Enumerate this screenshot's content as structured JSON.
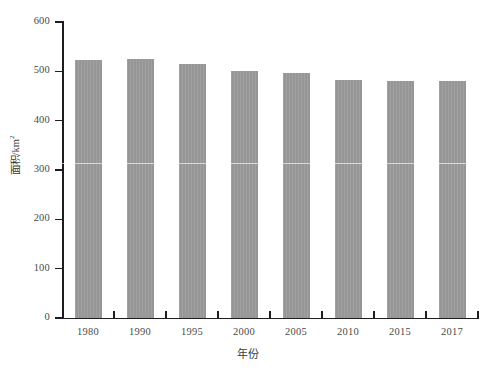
{
  "chart_data": {
    "type": "bar",
    "title": "",
    "subtitle": "",
    "categories": [
      "1980",
      "1990",
      "1995",
      "2000",
      "2005",
      "2010",
      "2015",
      "2017"
    ],
    "values": [
      522,
      525,
      515,
      501,
      496,
      483,
      481,
      481
    ],
    "series": [
      {
        "name": "面积",
        "values": [
          522,
          525,
          515,
          501,
          496,
          483,
          481,
          481
        ]
      }
    ],
    "xlabel": "年份",
    "ylabel": "面积/km",
    "ylabel_superscript": "2",
    "ylim": [
      0,
      600
    ],
    "ytick_labels": [
      "0",
      "100",
      "200",
      "300",
      "400",
      "500",
      "600"
    ],
    "ytick_values": [
      0,
      100,
      200,
      300,
      400,
      500,
      600
    ],
    "grid": false,
    "legend": "none",
    "bar_color": "#969696",
    "axis_color": "#1d1d1d",
    "tick_label_color": "#4a4a4a"
  }
}
